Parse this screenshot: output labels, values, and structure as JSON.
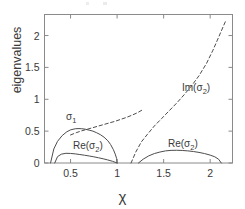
{
  "chart_data": {
    "type": "line",
    "title": "",
    "subtitle": "",
    "xlabel": "χ",
    "ylabel": "eigenvalues",
    "xlim": [
      0.22,
      2.24
    ],
    "ylim": [
      0,
      2.33
    ],
    "xticks": [
      "0.5",
      "1",
      "1.5",
      "2"
    ],
    "xtick_values": [
      0.5,
      1,
      1.5,
      2
    ],
    "yticks": [
      "0",
      "0.5",
      "1",
      "1.5",
      "2"
    ],
    "ytick_values": [
      0,
      0.5,
      1,
      1.5,
      2
    ],
    "grid": false,
    "legend": "none (inline annotations)",
    "line_color": "#4d4d4d",
    "background": "#ffffff",
    "series": [
      {
        "name": "σ₁",
        "style": "solid",
        "annotation": "σ₁",
        "x": [
          0.285,
          0.32,
          0.36,
          0.41,
          0.46,
          0.5,
          0.55,
          0.58,
          0.62,
          0.66,
          0.7,
          0.74,
          0.78,
          0.82,
          0.86,
          0.9,
          0.93,
          0.96,
          0.98,
          0.995,
          1.0
        ],
        "values": [
          0.0,
          0.22,
          0.34,
          0.43,
          0.49,
          0.52,
          0.537,
          0.54,
          0.538,
          0.53,
          0.515,
          0.5,
          0.475,
          0.445,
          0.405,
          0.35,
          0.29,
          0.21,
          0.14,
          0.07,
          0.0
        ]
      },
      {
        "name": "σ₁ dashed continuation",
        "style": "dashed",
        "annotation": "",
        "x": [
          0.5,
          0.56,
          0.62,
          0.68,
          0.74,
          0.8,
          0.86,
          0.92,
          0.98,
          1.04,
          1.1,
          1.16,
          1.22,
          1.28
        ],
        "values": [
          0.44,
          0.475,
          0.505,
          0.53,
          0.555,
          0.58,
          0.605,
          0.63,
          0.655,
          0.685,
          0.715,
          0.75,
          0.79,
          0.84
        ]
      },
      {
        "name": "Re(σ₂) left branch",
        "style": "solid",
        "annotation": "Re(σ₂)",
        "x": [
          0.33,
          0.36,
          0.4,
          0.45,
          0.5,
          0.55,
          0.6,
          0.65,
          0.7,
          0.75,
          0.8,
          0.85,
          0.9,
          0.95,
          1.0
        ],
        "values": [
          0.0,
          0.1,
          0.138,
          0.152,
          0.15,
          0.143,
          0.133,
          0.122,
          0.11,
          0.097,
          0.082,
          0.066,
          0.048,
          0.027,
          0.0
        ]
      },
      {
        "name": "Re(σ₂) right branch",
        "style": "solid",
        "annotation": "Re(σ₂)",
        "x": [
          1.23,
          1.28,
          1.34,
          1.4,
          1.46,
          1.52,
          1.58,
          1.64,
          1.7,
          1.76,
          1.82,
          1.88,
          1.94,
          2.0,
          2.05,
          2.09,
          2.12
        ],
        "values": [
          0.0,
          0.06,
          0.112,
          0.148,
          0.172,
          0.19,
          0.198,
          0.2,
          0.197,
          0.19,
          0.18,
          0.166,
          0.148,
          0.124,
          0.097,
          0.06,
          0.0
        ]
      },
      {
        "name": "Im(σ₂)",
        "style": "dashed",
        "annotation": "Im(σ₂)",
        "x": [
          1.15,
          1.2,
          1.26,
          1.32,
          1.4,
          1.48,
          1.56,
          1.64,
          1.72,
          1.8,
          1.88,
          1.96,
          2.03,
          2.09,
          2.14,
          2.17
        ],
        "values": [
          0.0,
          0.17,
          0.33,
          0.44,
          0.58,
          0.7,
          0.82,
          0.94,
          1.07,
          1.21,
          1.37,
          1.56,
          1.77,
          1.97,
          2.14,
          2.24
        ]
      }
    ],
    "annotations": [
      {
        "id": "sigma1",
        "text": "σ",
        "sub": "1",
        "x_px": 66,
        "y_px": 111
      },
      {
        "id": "re-sigma2-left",
        "text": "Re(σ",
        "sub": "2",
        "tail": ")",
        "x_px": 73,
        "y_px": 140
      },
      {
        "id": "re-sigma2-right",
        "text": "Re(σ",
        "sub": "2",
        "tail": ")",
        "x_px": 168,
        "y_px": 138
      },
      {
        "id": "im-sigma2",
        "text": "Im(σ",
        "sub": "2",
        "tail": ")",
        "x_px": 182,
        "y_px": 82
      }
    ]
  }
}
